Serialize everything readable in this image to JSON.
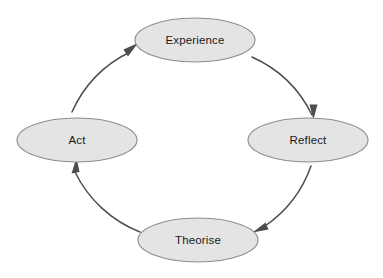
{
  "diagram": {
    "background_color": "#ffffff",
    "node_fill_color": "#e4e4e4",
    "node_stroke_color": "#8c8c8c",
    "arc_stroke_color": "#4d4d4d",
    "arrow_fill_color": "#4d4d4d",
    "label_color": "#1a1a1a",
    "center": {
      "x": 192,
      "y": 140
    },
    "arc_radius": 122,
    "direction": "clockwise",
    "nodes": [
      {
        "id": "experience",
        "label": "Experience",
        "position": "top",
        "cx": 195,
        "cy": 40,
        "rx": 60,
        "ry": 22
      },
      {
        "id": "reflect",
        "label": "Reflect",
        "position": "right",
        "cx": 308,
        "cy": 140,
        "rx": 60,
        "ry": 22
      },
      {
        "id": "theorise",
        "label": "Theorise",
        "position": "bottom",
        "cx": 198,
        "cy": 240,
        "rx": 60,
        "ry": 22
      },
      {
        "id": "act",
        "label": "Act",
        "position": "left",
        "cx": 77,
        "cy": 140,
        "rx": 60,
        "ry": 22
      }
    ],
    "connections": [
      {
        "id": "experience-to-reflect",
        "from": "Experience",
        "to": "Reflect",
        "arrow_direction": "down"
      },
      {
        "id": "reflect-to-theorise",
        "from": "Reflect",
        "to": "Theorise",
        "arrow_direction": "left"
      },
      {
        "id": "theorise-to-act",
        "from": "Theorise",
        "to": "Act",
        "arrow_direction": "up"
      },
      {
        "id": "act-to-experience",
        "from": "Act",
        "to": "Experience",
        "arrow_direction": "up-right"
      }
    ]
  }
}
